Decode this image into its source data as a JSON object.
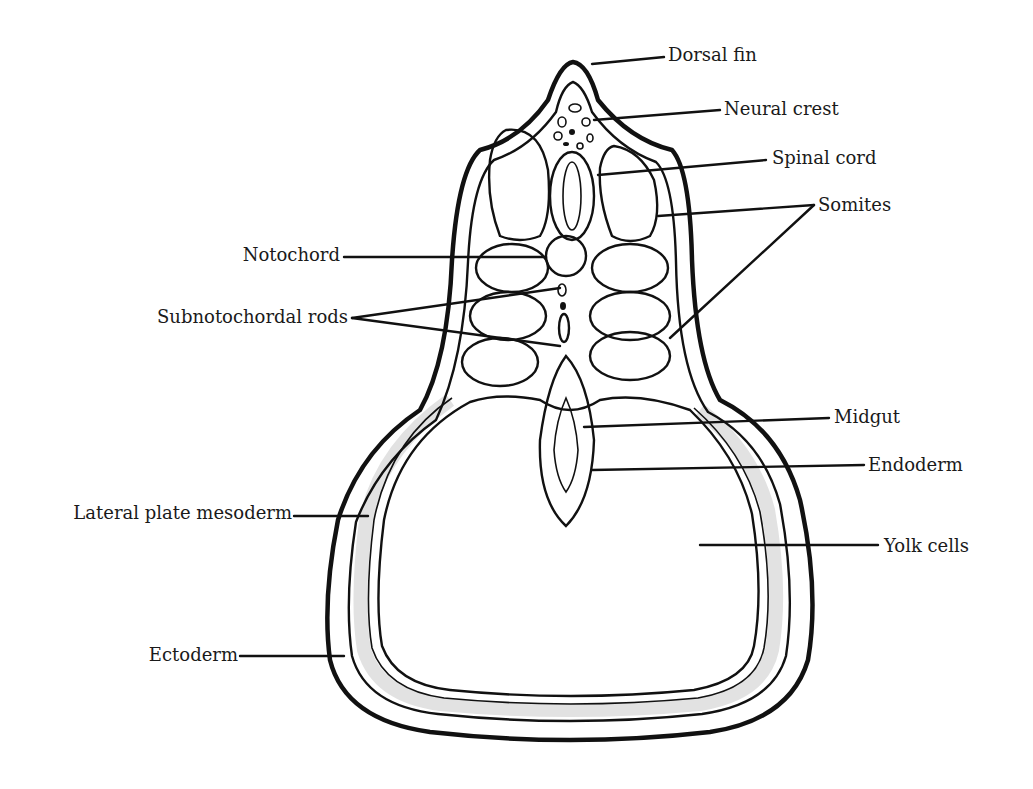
{
  "figure": {
    "colors": {
      "ink": "#111111",
      "background": "#ffffff"
    }
  },
  "labels": [
    {
      "id": "dorsal-fin",
      "text": "Dorsal fin",
      "side": "right"
    },
    {
      "id": "neural-crest",
      "text": "Neural crest",
      "side": "right"
    },
    {
      "id": "spinal-cord",
      "text": "Spinal cord",
      "side": "right"
    },
    {
      "id": "somites",
      "text": "Somites",
      "side": "right"
    },
    {
      "id": "notochord",
      "text": "Notochord",
      "side": "left"
    },
    {
      "id": "subnotochordal-rods",
      "text": "Subnotochordal rods",
      "side": "left"
    },
    {
      "id": "midgut",
      "text": "Midgut",
      "side": "right"
    },
    {
      "id": "endoderm",
      "text": "Endoderm",
      "side": "right"
    },
    {
      "id": "lateral-plate-mesoderm",
      "text": "Lateral plate mesoderm",
      "side": "left"
    },
    {
      "id": "yolk-cells",
      "text": "Yolk cells",
      "side": "right"
    },
    {
      "id": "ectoderm",
      "text": "Ectoderm",
      "side": "left"
    }
  ]
}
